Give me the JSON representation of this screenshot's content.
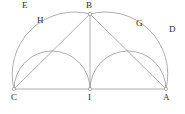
{
  "figure": {
    "caption": "",
    "stroke_color": "#9a9a9a",
    "label_color": "#2b2b2b",
    "background": "#ffffff",
    "points": [
      {
        "id": "C",
        "label": "C",
        "x": 14,
        "y": 89,
        "label_x": 11,
        "label_y": 93,
        "marker": true
      },
      {
        "id": "I",
        "label": "I",
        "x": 90,
        "y": 89,
        "label_x": 87,
        "label_y": 93,
        "marker": true
      },
      {
        "id": "A",
        "label": "A",
        "x": 166,
        "y": 89,
        "label_x": 163,
        "label_y": 93,
        "marker": true
      },
      {
        "id": "B",
        "label": "B",
        "x": 90,
        "y": 14,
        "label_x": 86,
        "label_y": 2,
        "marker": true
      }
    ],
    "arc_labels": [
      {
        "id": "E",
        "label": "E",
        "label_x": 24,
        "label_y": 2
      },
      {
        "id": "H",
        "label": "H",
        "label_x": 38,
        "label_y": 16
      },
      {
        "id": "G",
        "label": "G",
        "label_x": 137,
        "label_y": 19
      },
      {
        "id": "D",
        "label": "D",
        "label_x": 170,
        "label_y": 25
      }
    ],
    "segments": [
      {
        "id": "CA",
        "from": "C",
        "to": "A",
        "note": "base line"
      },
      {
        "id": "IB",
        "from": "I",
        "to": "B",
        "note": "vertical altitude"
      },
      {
        "id": "CB",
        "from": "C",
        "to": "B",
        "note": "chord"
      },
      {
        "id": "BA",
        "from": "B",
        "to": "A",
        "note": "chord"
      }
    ],
    "arcs": [
      {
        "id": "arc-E",
        "note": "large left semicircle on diameter C-I, passing through E",
        "d": "M 14 89 A 38 38 0 0 1 90 89"
      },
      {
        "id": "arc-D",
        "note": "large right semicircle on diameter I-A, passing through D",
        "d": "M 90 89 A 38 38 0 0 1 166 89"
      },
      {
        "id": "arc-H",
        "note": "inner arc from C to B labelled H",
        "d": "M 14 89 A 62 62 0 0 1 90 14"
      },
      {
        "id": "arc-G",
        "note": "inner arc from B to A labelled G",
        "d": "M 90 14 A 62 62 0 0 1 166 89"
      }
    ]
  }
}
